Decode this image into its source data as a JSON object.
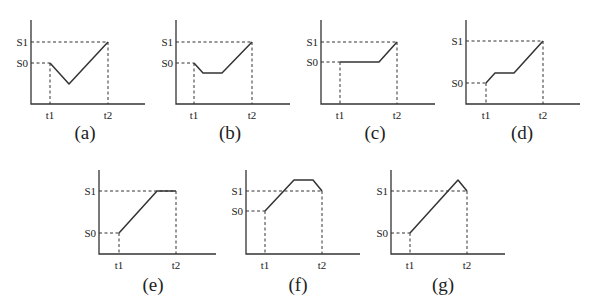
{
  "figure": {
    "panels": [
      {
        "id": "a",
        "caption": "(a)",
        "labels": {
          "s1": "S1",
          "s0": "S0",
          "t1": "t1",
          "t2": "t2"
        },
        "origin": [
          31,
          104
        ],
        "top": 20,
        "axis_end_x": 145,
        "s1_y": 42,
        "s0_y": 63,
        "t1_x": 50,
        "t2_x": 108,
        "curve": [
          [
            50,
            63
          ],
          [
            69,
            84
          ],
          [
            108,
            42
          ]
        ],
        "caption_pos": [
          85,
          139
        ]
      },
      {
        "id": "b",
        "caption": "(b)",
        "labels": {
          "s1": "S1",
          "s0": "S0",
          "t1": "t1",
          "t2": "t2"
        },
        "origin": [
          176,
          104
        ],
        "top": 20,
        "axis_end_x": 290,
        "s1_y": 42,
        "s0_y": 63,
        "t1_x": 194,
        "t2_x": 252,
        "curve": [
          [
            194,
            63
          ],
          [
            203,
            73
          ],
          [
            222,
            73
          ],
          [
            252,
            42
          ]
        ],
        "caption_pos": [
          230,
          139
        ]
      },
      {
        "id": "c",
        "caption": "(c)",
        "labels": {
          "s1": "S1",
          "s0": "S0",
          "t1": "t1",
          "t2": "t2"
        },
        "origin": [
          321,
          104
        ],
        "top": 20,
        "axis_end_x": 435,
        "s1_y": 42,
        "s0_y": 62,
        "t1_x": 340,
        "t2_x": 397,
        "curve": [
          [
            340,
            62
          ],
          [
            379,
            62
          ],
          [
            397,
            42
          ]
        ],
        "caption_pos": [
          375,
          139
        ]
      },
      {
        "id": "d",
        "caption": "(d)",
        "labels": {
          "s1": "S1",
          "s0": "S0",
          "t1": "t1",
          "t2": "t2"
        },
        "origin": [
          466,
          104
        ],
        "top": 20,
        "axis_end_x": 580,
        "s1_y": 41,
        "s0_y": 83,
        "t1_x": 486,
        "t2_x": 543,
        "curve": [
          [
            486,
            83
          ],
          [
            495,
            73
          ],
          [
            514,
            73
          ],
          [
            543,
            41
          ]
        ],
        "caption_pos": [
          522,
          139
        ]
      },
      {
        "id": "e",
        "caption": "(e)",
        "labels": {
          "s1": "S1",
          "s0": "S0",
          "t1": "t1",
          "t2": "t2"
        },
        "origin": [
          99,
          254
        ],
        "top": 170,
        "axis_end_x": 216,
        "s1_y": 191,
        "s0_y": 233,
        "t1_x": 119,
        "t2_x": 176,
        "curve": [
          [
            119,
            233
          ],
          [
            157,
            191
          ],
          [
            176,
            191
          ]
        ],
        "caption_pos": [
          153,
          291
        ]
      },
      {
        "id": "f",
        "caption": "(f)",
        "labels": {
          "s1": "S1",
          "s0": "S0",
          "t1": "t1",
          "t2": "t2"
        },
        "origin": [
          246,
          254
        ],
        "top": 170,
        "axis_end_x": 360,
        "s1_y": 191,
        "s0_y": 211,
        "t1_x": 265,
        "t2_x": 322,
        "curve": [
          [
            265,
            211
          ],
          [
            294,
            180
          ],
          [
            313,
            180
          ],
          [
            322,
            191
          ]
        ],
        "caption_pos": [
          298,
          291
        ]
      },
      {
        "id": "g",
        "caption": "(g)",
        "labels": {
          "s1": "S1",
          "s0": "S0",
          "t1": "t1",
          "t2": "t2"
        },
        "origin": [
          391,
          254
        ],
        "top": 170,
        "axis_end_x": 505,
        "s1_y": 191,
        "s0_y": 233,
        "t1_x": 410,
        "t2_x": 467,
        "curve": [
          [
            410,
            233
          ],
          [
            458,
            180
          ],
          [
            467,
            191
          ]
        ],
        "caption_pos": [
          443,
          291
        ]
      }
    ]
  }
}
